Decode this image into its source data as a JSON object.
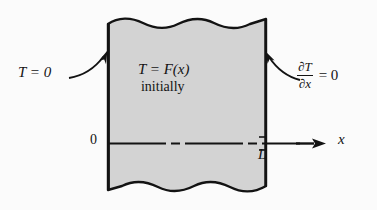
{
  "figure": {
    "type": "heat-conduction-slab-diagram",
    "background_color": "#fbfbfb",
    "slab": {
      "fill_color": "#d3d3d3",
      "stroke_color": "#131313",
      "left_edge_label": "0",
      "right_edge_label": "L",
      "top_edge_style": "wavy",
      "bottom_edge_style": "wavy"
    },
    "labels": {
      "left_boundary": "T = 0",
      "interior_condition": "T = F(x)",
      "interior_condition_note": "initially",
      "right_boundary_numerator": "∂T",
      "right_boundary_denominator": "∂x",
      "right_boundary_equals": "= 0",
      "origin": "0",
      "length": "L",
      "axis": "x"
    },
    "arrows": {
      "left_pointer": "curved-arrow-to-left-face",
      "right_pointer": "curved-arrow-to-right-face",
      "axis_arrow": "x-axis-arrow"
    }
  }
}
